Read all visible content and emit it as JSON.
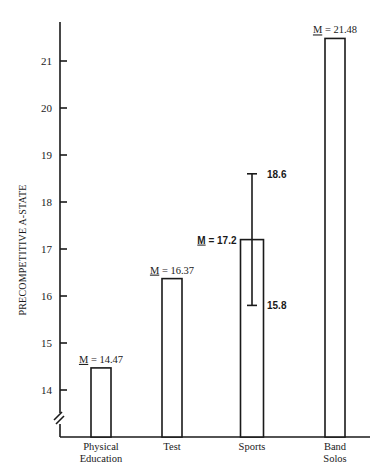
{
  "chart_data": {
    "type": "bar",
    "title": "",
    "xlabel": "",
    "ylabel": "PRECOMPETITIVE A-STATE",
    "categories": [
      "Physical Education",
      "Test",
      "Sports",
      "Band Solos"
    ],
    "category_lines": [
      [
        "Physical",
        "Education"
      ],
      [
        "Test"
      ],
      [
        "Sports"
      ],
      [
        "Band",
        "Solos"
      ]
    ],
    "values": [
      14.47,
      16.37,
      17.2,
      21.48
    ],
    "value_labels": [
      "M = 14.47",
      "M = 16.37",
      "M = 17.2",
      "M = 21.48"
    ],
    "mean_symbol": "M",
    "error_bars": [
      {
        "category": "Sports",
        "upper": 18.6,
        "lower": 15.8,
        "upper_label": "18.6",
        "lower_label": "15.8"
      }
    ],
    "yticks": [
      14,
      15,
      16,
      17,
      18,
      19,
      20,
      21
    ],
    "ylim": [
      13.3,
      21.8
    ],
    "axis_break": true,
    "grid": false,
    "legend": null
  }
}
